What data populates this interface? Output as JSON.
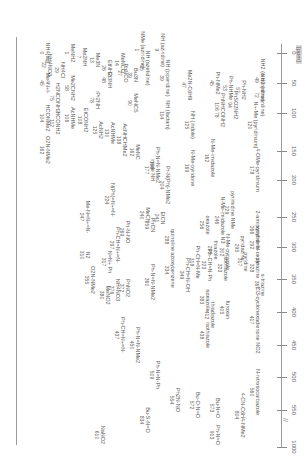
{
  "chart_data": {
    "type": "scatter",
    "title": "",
    "xlabel": "[ppm]",
    "ylabel": "",
    "axis": {
      "ticks": [
        0,
        50,
        100,
        150,
        200,
        250,
        300,
        350,
        400,
        450,
        500,
        550,
        1000
      ],
      "break_between": [
        550,
        1000
      ],
      "unit": "[ppm]"
    },
    "orientation": "rotated-90",
    "compounds": [
      {
        "name": "Me4N+",
        "shift": 45
      },
      {
        "name": "NH4+ (aq)",
        "shift": 0
      },
      {
        "name": "MeNH2",
        "shift": 1
      },
      {
        "name": "NH4Cl",
        "shift": 29
      },
      {
        "name": "NH4NO3",
        "shift": 22
      },
      {
        "name": "Me2NH",
        "shift": 7
      },
      {
        "name": "Me3N",
        "shift": 13
      },
      {
        "name": "EtNH2",
        "shift": 26
      },
      {
        "name": "MeNCO",
        "shift": 14
      },
      {
        "name": "aziridine NMe",
        "shift": 1
      },
      {
        "name": "aziridine NH",
        "shift": 9
      },
      {
        "name": "azetidine NH",
        "shift": 25
      },
      {
        "name": "Bu3N",
        "shift": 39
      },
      {
        "name": "PhNCO",
        "shift": 27
      },
      {
        "name": "Et3NH",
        "shift": 48
      },
      {
        "name": "piperidine NH",
        "shift": 39
      },
      {
        "name": "Me2N-cyclohexene",
        "shift": 47
      },
      {
        "name": "o-anisidine NH2",
        "shift": 49
      },
      {
        "name": "Ph-NH2",
        "shift": 57
      },
      {
        "name": "Ph-NHMe",
        "shift": 53
      },
      {
        "name": "Ph-NMe2",
        "shift": 45
      },
      {
        "name": "Me2CNH2",
        "shift": 58
      },
      {
        "name": "H2NCONH2",
        "shift": 75
      },
      {
        "name": "Me4N+ I-",
        "shift": 46
      },
      {
        "name": "MeNCS",
        "shift": 90
      },
      {
        "name": "diisopropylamine NH",
        "shift": 78
      },
      {
        "name": "m-nitroaniline NH2",
        "shift": 72
      },
      {
        "name": "PhSO2NH2",
        "shift": 94
      },
      {
        "name": "PhNHCONH2",
        "shift": 106
      },
      {
        "name": "PhNHCONH2 (2)",
        "shift": 78
      },
      {
        "name": "N-methylpyridinium",
        "shift": 120
      },
      {
        "name": "indole NH",
        "shift": 125
      },
      {
        "name": "piperidinone NH",
        "shift": 114
      },
      {
        "name": "AcNHCHMe2",
        "shift": 138
      },
      {
        "name": "AcNHMe",
        "shift": 130
      },
      {
        "name": "AcNH2",
        "shift": 125
      },
      {
        "name": "EtCONH2",
        "shift": 108
      },
      {
        "name": "AcNHMe (2)",
        "shift": 106
      },
      {
        "name": "HCONH2",
        "shift": 112
      },
      {
        "name": "HCONMe2",
        "shift": 104
      },
      {
        "name": "MeNC",
        "shift": 162
      },
      {
        "name": "O2N-NMe2",
        "shift": 162
      },
      {
        "name": "imide NH",
        "shift": 177
      },
      {
        "name": "4-methoxypyridinium",
        "shift": 178
      },
      {
        "name": "N-methylimidazole N1",
        "shift": 162
      },
      {
        "name": "N-methyl-2-pyridone",
        "shift": 169
      },
      {
        "name": "glutarimide NMe",
        "shift": 166
      },
      {
        "name": "guanidine NMe2",
        "shift": 204
      },
      {
        "name": "Ph-N=N-NMe2",
        "shift": 166
      },
      {
        "name": "MeCN",
        "shift": 240
      },
      {
        "name": "EtCN",
        "shift": 241
      },
      {
        "name": "PhCN",
        "shift": 259
      },
      {
        "name": "N=N+=N- Ph (azide)",
        "shift": 224
      },
      {
        "name": "Me-N=N+=N-",
        "shift": 247
      },
      {
        "name": "Ph-N=O (PhN-NO)",
        "shift": 269
      },
      {
        "name": "2-aminopyridine N",
        "shift": 266
      },
      {
        "name": "pyrimidine N",
        "shift": 229
      },
      {
        "name": "N-methylimidazole N3",
        "shift": 246
      },
      {
        "name": "oxazole N",
        "shift": 256
      },
      {
        "name": "quinoline N",
        "shift": 288
      },
      {
        "name": "pyridine N-oxide",
        "shift": 292
      },
      {
        "name": "pyridazine N",
        "shift": 295
      },
      {
        "name": "N-methylpyrazole N2",
        "shift": 302
      },
      {
        "name": "thiazole N",
        "shift": 298
      },
      {
        "name": "Ph-CH=N-Ph",
        "shift": 323
      },
      {
        "name": "Ph-CH=N-Me",
        "shift": 318
      },
      {
        "name": "Ph-CH=N-OH",
        "shift": 349
      },
      {
        "name": "pyridine N",
        "shift": 317
      },
      {
        "name": "pyrazine N",
        "shift": 328
      },
      {
        "name": "isothiazole N",
        "shift": 323
      },
      {
        "name": "Ph-CH=N+=N-",
        "shift": 297
      },
      {
        "name": "N=N+ Ph",
        "shift": 317
      },
      {
        "name": "N2",
        "shift": 310
      },
      {
        "name": "PhN(O)=NPh azoxy",
        "shift": 334
      },
      {
        "name": "Ph-N=N-NMe2 (2)",
        "shift": 360
      },
      {
        "name": "PhNO2",
        "shift": 372
      },
      {
        "name": "NH4NO3 (NO3)",
        "shift": 376
      },
      {
        "name": "MeNO2",
        "shift": 380
      },
      {
        "name": "O2N-NMe2 (NO2)",
        "shift": 355
      },
      {
        "name": "s-triazine N",
        "shift": 367
      },
      {
        "name": "isoxazole N",
        "shift": 383
      },
      {
        "name": "furoxan N",
        "shift": 405
      },
      {
        "name": "thiadiazole N",
        "shift": 412
      },
      {
        "name": "isothiazole N (2)",
        "shift": 438
      },
      {
        "name": "trichlorophenyl NO2",
        "shift": 417
      },
      {
        "name": "Ph-N=N-NMe2 (3)",
        "shift": 450
      },
      {
        "name": "Ph-CH=N+=N-",
        "shift": 437
      },
      {
        "name": "Ph-N=N-Ph",
        "shift": 509
      },
      {
        "name": "Ph2N-NO",
        "shift": 554
      },
      {
        "name": "Bu-O-N=O",
        "shift": 572
      },
      {
        "name": "N-nitrosocarbazole",
        "shift": 560
      },
      {
        "name": "Bu-N=O",
        "shift": 573
      },
      {
        "name": "Bu-S-N=O",
        "shift": 834
      },
      {
        "name": "NaNO2",
        "shift": 610
      },
      {
        "name": "4-cyano-N,N-dimethylaniline (N-NO)",
        "shift": 804
      },
      {
        "name": "Ph-N=O",
        "shift": 913
      }
    ]
  },
  "axis": {
    "unit": "[ppm]",
    "ticks": [
      {
        "label": "0",
        "pos": 53
      },
      {
        "label": "50",
        "pos": 83
      },
      {
        "label": "100",
        "pos": 113
      },
      {
        "label": "150",
        "pos": 151
      },
      {
        "label": "200",
        "pos": 180
      },
      {
        "label": "250",
        "pos": 217
      },
      {
        "label": "300",
        "pos": 247
      },
      {
        "label": "350",
        "pos": 279
      },
      {
        "label": "400",
        "pos": 312
      },
      {
        "label": "450",
        "pos": 345
      },
      {
        "label": "500",
        "pos": 377
      },
      {
        "label": "550",
        "pos": 410
      },
      {
        "label": "1000",
        "pos": 447
      }
    ],
    "break_symbol": "//"
  },
  "labels": [
    {
      "n": "Me4N+I-",
      "s": "45",
      "x": 83,
      "y": 30
    },
    {
      "n": "NH4(aq)",
      "s": "0",
      "x": 53,
      "y": 30
    },
    {
      "n": "MeNH2",
      "s": "1",
      "x": 53,
      "y": 55
    },
    {
      "n": "NH4Cl",
      "s": "29",
      "x": 70,
      "y": 45
    },
    {
      "n": "NH4NO3",
      "s": "22",
      "x": 65,
      "y": 32
    },
    {
      "n": "H2NCONH2",
      "s": "75",
      "x": 98,
      "y": 40
    },
    {
      "n": "HCONMe2",
      "s": "104",
      "x": 118,
      "y": 30
    },
    {
      "n": "HCONH2",
      "s": "112",
      "x": 123,
      "y": 40
    },
    {
      "n": "O2N-NMe2",
      "s": "162",
      "x": 150,
      "y": 30
    },
    {
      "n": "Me2NH",
      "s": "7",
      "x": 57,
      "y": 67
    },
    {
      "n": "Me3N",
      "s": "13",
      "x": 60,
      "y": 80
    },
    {
      "n": "Me2CNH2",
      "s": "58",
      "x": 88,
      "y": 55
    },
    {
      "n": "AcNHMe",
      "s": "106",
      "x": 118,
      "y": 55
    },
    {
      "n": "EtCONH2",
      "s": "108",
      "x": 120,
      "y": 68
    },
    {
      "n": "EtNH2",
      "s": "26",
      "x": 68,
      "y": 92
    },
    {
      "n": "MeNCO",
      "s": "14",
      "x": 63,
      "y": 105
    },
    {
      "n": "Et3NH",
      "s": "48",
      "x": 80,
      "y": 92
    },
    {
      "n": "PhNCO",
      "s": "27",
      "x": 73,
      "y": 108
    },
    {
      "n": "AcNH2",
      "s": "125",
      "x": 130,
      "y": 83
    },
    {
      "n": "AcNHMe",
      "s": "130",
      "x": 133,
      "y": 95
    },
    {
      "n": "AcNHCHMe2",
      "s": "138",
      "x": 140,
      "y": 107
    },
    {
      "n": "MeNC",
      "s": "162",
      "x": 152,
      "y": 120
    },
    {
      "n": "iPr2NH",
      "s": "78",
      "x": 100,
      "y": 80
    },
    {
      "n": "MeNCS",
      "s": "90",
      "x": 103,
      "y": 118
    },
    {
      "n": "Bu3N",
      "s": "39",
      "x": 75,
      "y": 118
    },
    {
      "n": "NH (azetidine)",
      "s": "25",
      "x": 68,
      "y": 130
    },
    {
      "n": "NMe (aziridine)",
      "s": "1",
      "x": 50,
      "y": 125
    },
    {
      "n": "NH (aziridine)",
      "s": "9",
      "x": 50,
      "y": 145
    },
    {
      "n": "NH (piperidine)",
      "s": "39",
      "x": 78,
      "y": 150
    },
    {
      "n": "Me2N-C6H9",
      "s": "47",
      "x": 85,
      "y": 172
    },
    {
      "n": "NH (lactam)",
      "s": "114",
      "x": 115,
      "y": 150
    },
    {
      "n": "NH (indole)",
      "s": "125",
      "x": 125,
      "y": 175
    },
    {
      "n": "Ph-NMe2",
      "s": "45",
      "x": 83,
      "y": 200
    },
    {
      "n": "Ph-NHMe",
      "s": "53",
      "x": 88,
      "y": 213
    },
    {
      "n": "Ph-NH2",
      "s": "57",
      "x": 90,
      "y": 226
    },
    {
      "n": "PhNHCONH2",
      "s": "106  78",
      "x": 110,
      "y": 205
    },
    {
      "n": "PhSO2NH2",
      "s": "94",
      "x": 105,
      "y": 218
    },
    {
      "n": "NH2 (o-anisidine)",
      "s": "49",
      "x": 80,
      "y": 245
    },
    {
      "n": "NH2 (nitroaniline)",
      "s": "72",
      "x": 95,
      "y": 245
    },
    {
      "n": "N+-Me (pyridinium)",
      "s": "120",
      "x": 125,
      "y": 238
    },
    {
      "n": "Pr-N(Ph)-NMe2",
      "s": "204",
      "x": 185,
      "y": 150
    },
    {
      "n": "Ph-N=N-NMe2",
      "s": "166",
      "x": 165,
      "y": 140
    },
    {
      "n": "imide NH",
      "s": "177",
      "x": 170,
      "y": 135
    },
    {
      "n": "N-Me-pyridone",
      "s": "169",
      "x": 168,
      "y": 175
    },
    {
      "n": "N-Me-imidazole",
      "s": "162",
      "x": 158,
      "y": 195
    },
    {
      "n": "4-OMe-pyridinium",
      "s": "178",
      "x": 170,
      "y": 240
    },
    {
      "n": "N(Ph)=N+=N-",
      "s": "224",
      "x": 200,
      "y": 95
    },
    {
      "n": "Me-N=N+=N-",
      "s": "247",
      "x": 217,
      "y": 70
    },
    {
      "n": "MeCN",
      "s": "240",
      "x": 215,
      "y": 130
    },
    {
      "n": "EtCN",
      "s": "241",
      "x": 218,
      "y": 145
    },
    {
      "n": "PhCN",
      "s": "259",
      "x": 225,
      "y": 135
    },
    {
      "n": "Ph-N-NO",
      "s": "269",
      "x": 232,
      "y": 110
    },
    {
      "n": "quinoline",
      "s": "288",
      "x": 240,
      "y": 155
    },
    {
      "n": "2-aminopyridine",
      "s": "266",
      "x": 230,
      "y": 240
    },
    {
      "n": "pyrimidine NMe",
      "s": "229",
      "x": 210,
      "y": 215
    },
    {
      "n": "N-Me-imidazole N3",
      "s": "246",
      "x": 220,
      "y": 205
    },
    {
      "n": "oxazole",
      "s": "256",
      "x": 225,
      "y": 190
    },
    {
      "n": "Ph-CH=N+=N-",
      "s": "297",
      "x": 245,
      "y": 100
    },
    {
      "n": "N=N+ Ph",
      "s": "317",
      "x": 262,
      "y": 92
    },
    {
      "n": "N2",
      "s": "310",
      "x": 255,
      "y": 70
    },
    {
      "n": "O2N-NMe2",
      "s": "355",
      "x": 280,
      "y": 75
    },
    {
      "n": "MeNO2",
      "s": "380",
      "x": 295,
      "y": 90
    },
    {
      "n": "NH4NO3",
      "s": "376",
      "x": 290,
      "y": 100
    },
    {
      "n": "PhNO2",
      "s": "372",
      "x": 288,
      "y": 110
    },
    {
      "n": "Ph-N=N-NMe2",
      "s": "360",
      "x": 282,
      "y": 135
    },
    {
      "n": "azoxybenzene",
      "s": "334",
      "x": 270,
      "y": 155
    },
    {
      "n": "Ph-CH=N-OH",
      "s": "349",
      "x": 275,
      "y": 170
    },
    {
      "n": "Ph-CH=N-Me",
      "s": "318",
      "x": 262,
      "y": 180
    },
    {
      "n": "Ph-CH=N-Ph",
      "s": "323",
      "x": 265,
      "y": 192
    },
    {
      "n": "pyridine N-oxide",
      "s": "292",
      "x": 245,
      "y": 240
    },
    {
      "n": "pyridazine",
      "s": "295",
      "x": 248,
      "y": 225
    },
    {
      "n": "N-Me-pyrazole",
      "s": "302",
      "x": 252,
      "y": 210
    },
    {
      "n": "thiazole",
      "s": "298",
      "x": 250,
      "y": 198
    },
    {
      "n": "isothiazole",
      "s": "323",
      "x": 268,
      "y": 208
    },
    {
      "n": "pyridine",
      "s": "317",
      "x": 262,
      "y": 228
    },
    {
      "n": "pyrazine",
      "s": "328",
      "x": 268,
      "y": 240
    },
    {
      "n": "s-triazine",
      "s": "367",
      "x": 285,
      "y": 245
    },
    {
      "n": "isoxazole",
      "s": "383",
      "x": 300,
      "y": 190
    },
    {
      "n": "furoxan",
      "s": "405",
      "x": 310,
      "y": 210
    },
    {
      "n": "thiadiazole",
      "s": "412",
      "x": 315,
      "y": 195
    },
    {
      "n": "isothiazole",
      "s": "438",
      "x": 335,
      "y": 190
    },
    {
      "n": "Cl3-cyclohexadienone NO2",
      "s": "417",
      "x": 320,
      "y": 240
    },
    {
      "n": "Ph-N=N-NMe2",
      "s": "450",
      "x": 345,
      "y": 120
    },
    {
      "n": "Ph-CH=N+=N-",
      "s": "437",
      "x": 335,
      "y": 105
    },
    {
      "n": "Ph-N=N-Ph",
      "s": "509",
      "x": 375,
      "y": 140
    },
    {
      "n": "Ph2N-NO",
      "s": "554",
      "x": 400,
      "y": 160
    },
    {
      "n": "Bu-O-N=O",
      "s": "572",
      "x": 405,
      "y": 180
    },
    {
      "n": "Bu-N=O",
      "s": "573",
      "x": 408,
      "y": 200
    },
    {
      "n": "Bu-S-N=O",
      "s": "834",
      "x": 420,
      "y": 130
    },
    {
      "n": "NaNO2",
      "s": "610",
      "x": 435,
      "y": 85
    },
    {
      "n": "N-nitrosocarbazole",
      "s": "560",
      "x": 392,
      "y": 240
    },
    {
      "n": "4-CN-C6H4-NMe2",
      "s": "804",
      "x": 415,
      "y": 225
    },
    {
      "n": "Ph-N=O",
      "s": "913",
      "x": 435,
      "y": 200
    }
  ]
}
